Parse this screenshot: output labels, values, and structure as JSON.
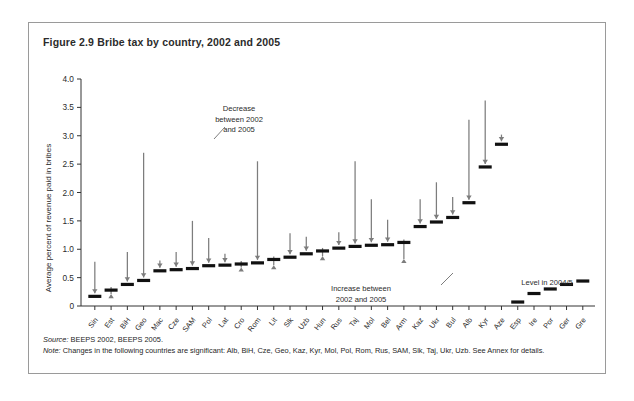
{
  "figure": {
    "title": "Figure 2.9  Bribe tax by country, 2002 and 2005",
    "source_label": "Source:",
    "source_text": " BEEPS 2002, BEEPS 2005.",
    "note_label": "Note:",
    "note_text": " Changes in the following countries are significant: Alb, BiH, Cze, Geo, Kaz, Kyr, Mol, Pol, Rom, Rus, SAM, Slk, Taj, Ukr, Uzb. See Annex for details."
  },
  "colors": {
    "bar_2005": "#111111",
    "arrow_2002": "#7d7d7d",
    "axis": "#333333",
    "frame": "#9a9a9a",
    "text": "#2b2b2b"
  },
  "annotations": [
    {
      "name": "decrease",
      "lines": [
        "Decrease",
        "between 2002",
        "and 2005"
      ],
      "x": 210,
      "y": 88
    },
    {
      "name": "increase",
      "lines": [
        "Increase between",
        "2002 and 2005"
      ],
      "x": 332,
      "y": 268
    },
    {
      "name": "level",
      "lines": [
        "Level in 2004/5"
      ],
      "x": 518,
      "y": 262
    }
  ],
  "chart_data": {
    "type": "bar",
    "title": "Bribe tax by country, 2002 and 2005",
    "xlabel": "",
    "ylabel": "Average percent of revenue paid in bribes",
    "ylim": [
      0,
      4.0
    ],
    "yticks": [
      "0",
      "0.5",
      "1.0",
      "1.5",
      "2.0",
      "2.5",
      "3.0",
      "3.5",
      "4.0"
    ],
    "ytick_values": [
      0,
      0.5,
      1.0,
      1.5,
      2.0,
      2.5,
      3.0,
      3.5,
      4.0
    ],
    "grid": false,
    "legend": "none",
    "categories": [
      "Sin",
      "Est",
      "BiH",
      "Geo",
      "Mac",
      "Cze",
      "SAM",
      "Pol",
      "Lat",
      "Cro",
      "Rom",
      "Lit",
      "Slk",
      "Uzb",
      "Hun",
      "Rus",
      "Taj",
      "Mol",
      "Bel",
      "Arm",
      "Kaz",
      "Ukr",
      "Bul",
      "Alb",
      "Kyr",
      "Aze",
      "Esp",
      "Ire",
      "Por",
      "Ger",
      "Gre"
    ],
    "series": [
      {
        "name": "Level in 2004/5",
        "values": [
          0.17,
          0.28,
          0.38,
          0.45,
          0.62,
          0.64,
          0.66,
          0.71,
          0.72,
          0.74,
          0.76,
          0.82,
          0.86,
          0.92,
          0.97,
          1.02,
          1.05,
          1.07,
          1.08,
          1.12,
          1.4,
          1.48,
          1.56,
          1.82,
          2.45,
          2.85,
          0.07,
          0.22,
          0.3,
          0.38,
          0.44
        ]
      },
      {
        "name": "Level in 2002",
        "values": [
          0.78,
          0.21,
          0.95,
          2.7,
          0.8,
          0.95,
          1.5,
          1.2,
          0.92,
          0.68,
          2.55,
          0.72,
          1.28,
          1.22,
          0.88,
          1.3,
          2.55,
          1.88,
          1.52,
          0.83,
          1.88,
          2.18,
          1.92,
          3.28,
          3.62,
          3.02,
          null,
          null,
          null,
          null,
          null
        ]
      }
    ],
    "directions": [
      "down",
      "up",
      "down",
      "down",
      "down",
      "down",
      "down",
      "down",
      "down",
      "up",
      "down",
      "up",
      "down",
      "down",
      "up",
      "down",
      "down",
      "down",
      "down",
      "up",
      "down",
      "down",
      "down",
      "down",
      "down",
      "down",
      "none",
      "none",
      "none",
      "none",
      "none"
    ]
  }
}
